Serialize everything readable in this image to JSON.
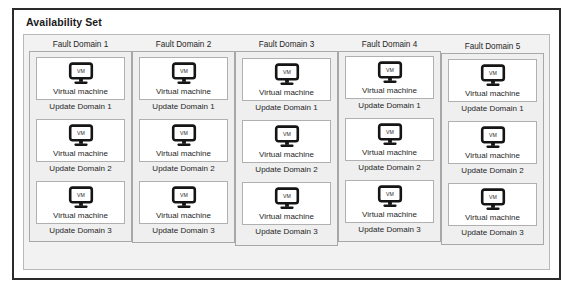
{
  "diagram": {
    "title": "Availability Set",
    "vm_icon_name": "virtual-machine-monitor-icon",
    "vm_icon_text": "VM",
    "colors": {
      "outer_border": "#2b2b2b",
      "panel_fill": "#f2f2f2",
      "panel_border": "#b9b9b9",
      "fault_domain_fill": "#efefef",
      "fault_domain_border": "#a8a8a8",
      "card_fill": "#ffffff",
      "card_border": "#b0b0b0",
      "icon_color": "#1a1a1a",
      "text_color": "#1f1f1f"
    },
    "fault_domains": [
      {
        "label": "Fault Domain 1",
        "update_domains": [
          {
            "vm_label": "Virtual machine",
            "label": "Update Domain 1"
          },
          {
            "vm_label": "Virtual machine",
            "label": "Update Domain 2"
          },
          {
            "vm_label": "Virtual machine",
            "label": "Update Domain 3"
          }
        ]
      },
      {
        "label": "Fault Domain 2",
        "update_domains": [
          {
            "vm_label": "Virtual machine",
            "label": "Update Domain 1"
          },
          {
            "vm_label": "Virtual machine",
            "label": "Update Domain 2"
          },
          {
            "vm_label": "Virtual machine",
            "label": "Update Domain 3"
          }
        ]
      },
      {
        "label": "Fault Domain 3",
        "update_domains": [
          {
            "vm_label": "Virtual machine",
            "label": "Update Domain 1"
          },
          {
            "vm_label": "Virtual machine",
            "label": "Update Domain 2"
          },
          {
            "vm_label": "Virtual machine",
            "label": "Update Domain 3"
          }
        ]
      },
      {
        "label": "Fault Domain 4",
        "update_domains": [
          {
            "vm_label": "Virtual machine",
            "label": "Update Domain 1"
          },
          {
            "vm_label": "Virtual machine",
            "label": "Update Domain 2"
          },
          {
            "vm_label": "Virtual machine",
            "label": "Update Domain 3"
          }
        ]
      },
      {
        "label": "Fault Domain 5",
        "update_domains": [
          {
            "vm_label": "Virtual machine",
            "label": "Update Domain 1"
          },
          {
            "vm_label": "Virtual machine",
            "label": "Update Domain 2"
          },
          {
            "vm_label": "Virtual machine",
            "label": "Update Domain 3"
          }
        ]
      }
    ]
  }
}
